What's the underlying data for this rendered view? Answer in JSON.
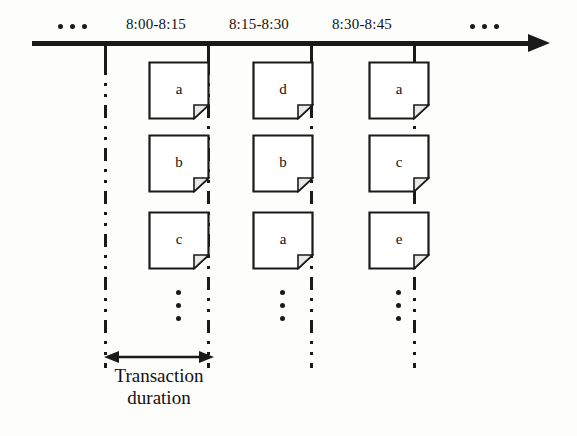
{
  "figure": {
    "axis": {
      "name": "timeline-axis",
      "direction": "right",
      "leading_ellipsis": "...",
      "trailing_ellipsis": "..."
    },
    "periods": [
      {
        "label": "8:00-8:15"
      },
      {
        "label": "8:15-8:30"
      },
      {
        "label": "8:30-8:45"
      }
    ],
    "columns": [
      {
        "period": "8:00-8:15",
        "documents": [
          {
            "letter": "a"
          },
          {
            "letter": "b"
          },
          {
            "letter": "c"
          }
        ],
        "more_indicator": "⋮"
      },
      {
        "period": "8:15-8:30",
        "documents": [
          {
            "letter": "d"
          },
          {
            "letter": "b"
          },
          {
            "letter": "a"
          }
        ],
        "more_indicator": "⋮"
      },
      {
        "period": "8:30-8:45",
        "documents": [
          {
            "letter": "a"
          },
          {
            "letter": "c"
          },
          {
            "letter": "e"
          }
        ],
        "more_indicator": "⋮"
      }
    ],
    "annotation": {
      "arrow_name": "transaction-duration-arrow",
      "caption_line1": "Transaction",
      "caption_line2": "duration"
    },
    "colors": {
      "ink": "#1a1a1a",
      "paper": "#ffffff",
      "background": "#fdfdfc",
      "fold": "#e8e8e8"
    }
  }
}
